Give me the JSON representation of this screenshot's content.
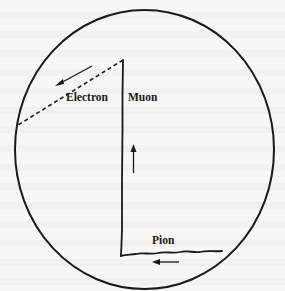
{
  "figure": {
    "labels": {
      "electron": "Electron",
      "muon": "Muon",
      "pion": "Pion"
    },
    "colors": {
      "ink": "#1a1a1a",
      "paper": "#f7f7f5"
    },
    "tracks": [
      {
        "name": "pion",
        "style": "solid-wavy",
        "direction": "right-to-left"
      },
      {
        "name": "muon",
        "style": "solid",
        "direction": "upward"
      },
      {
        "name": "electron",
        "style": "dashed",
        "direction": "down-left"
      }
    ],
    "arrows": [
      {
        "track": "electron",
        "direction": "down-left"
      },
      {
        "track": "muon",
        "direction": "up"
      },
      {
        "track": "pion",
        "direction": "left"
      }
    ]
  }
}
